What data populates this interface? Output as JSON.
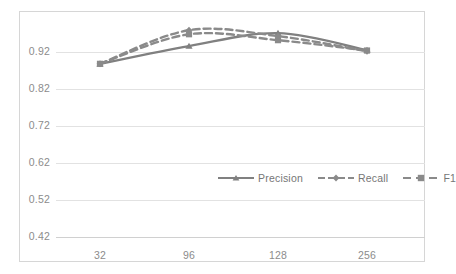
{
  "chart_data": {
    "type": "line",
    "title": "",
    "subtitle": "",
    "xlabel": "",
    "ylabel": "",
    "categories": [
      "32",
      "96",
      "128",
      "256"
    ],
    "x": [
      32,
      96,
      128,
      256
    ],
    "xtick_labels": [
      "32",
      "96",
      "128",
      "256"
    ],
    "ytick_labels": [
      "0.92",
      "0.82",
      "0.72",
      "0.62",
      "0.52",
      "0.42"
    ],
    "ytick_values": [
      0.92,
      0.82,
      0.72,
      0.62,
      0.52,
      0.42
    ],
    "ylim": [
      0.42,
      0.97
    ],
    "grid": true,
    "legend_position": "inside-center-right",
    "series": [
      {
        "name": "Precision",
        "values": [
          0.888,
          0.936,
          0.971,
          0.925
        ],
        "color": "#808080",
        "style": "solid",
        "marker": "triangle"
      },
      {
        "name": "Recall",
        "values": [
          0.888,
          0.979,
          0.963,
          0.922
        ],
        "color": "#8a8a8a",
        "style": "dashed",
        "marker": "diamond"
      },
      {
        "name": "F1",
        "values": [
          0.888,
          0.968,
          0.952,
          0.924
        ],
        "color": "#8a8a8a",
        "style": "dashed",
        "marker": "square"
      }
    ]
  },
  "legend": {
    "items": [
      {
        "label": "Precision"
      },
      {
        "label": "Recall"
      },
      {
        "label": "F1"
      }
    ]
  },
  "axes": {
    "y": {
      "ticks": [
        {
          "label": "0.92"
        },
        {
          "label": "0.82"
        },
        {
          "label": "0.72"
        },
        {
          "label": "0.62"
        },
        {
          "label": "0.52"
        },
        {
          "label": "0.42"
        }
      ]
    },
    "x": {
      "ticks": [
        {
          "label": "32"
        },
        {
          "label": "96"
        },
        {
          "label": "128"
        },
        {
          "label": "256"
        }
      ]
    }
  },
  "colors": {
    "series_gray": "#808080",
    "gridline": "#e2e2e2",
    "frame": "#d6d6d6",
    "tick_text": "#8c8c8c"
  }
}
